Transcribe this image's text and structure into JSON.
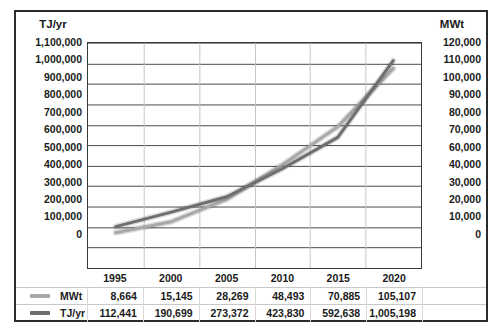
{
  "chart_data": {
    "type": "line",
    "title": "",
    "xlabel": "",
    "categories": [
      "1995",
      "2000",
      "2005",
      "2010",
      "2015",
      "2020"
    ],
    "grid": true,
    "legend_position": "bottom-table",
    "axes": {
      "left": {
        "label": "TJ/yr",
        "ticks": [
          "1,100,000",
          "1,000,000",
          "900,000",
          "800,000",
          "700,000",
          "600,000",
          "500,000",
          "400,000",
          "300,000",
          "200,000",
          "100,000",
          "0"
        ],
        "min": 0,
        "max": 1100000,
        "step": 100000
      },
      "right": {
        "label": "MWt",
        "ticks": [
          "120,000",
          "110,000",
          "100,000",
          "90,000",
          "80,000",
          "70,000",
          "60,000",
          "40,000",
          "30,000",
          "20,000",
          "10,000",
          "0"
        ],
        "min": 0,
        "max": 120000,
        "step": 10000
      }
    },
    "series": [
      {
        "name": "MWt",
        "axis": "right",
        "color": "#a8a8a8",
        "values": [
          8664,
          15145,
          28269,
          48493,
          70885,
          105107
        ],
        "values_text": [
          "8,664",
          "15,145",
          "28,269",
          "48,493",
          "70,885",
          "105,107"
        ]
      },
      {
        "name": "TJ/yr",
        "axis": "left",
        "color": "#6e6e6e",
        "values": [
          112441,
          190699,
          273372,
          423830,
          592638,
          1005198
        ],
        "values_text": [
          "112,441",
          "190,699",
          "273,372",
          "423,830",
          "592,638",
          "1,005,198"
        ]
      }
    ]
  },
  "table": {
    "years": [
      "1995",
      "2000",
      "2005",
      "2010",
      "2015",
      "2020"
    ],
    "rows": [
      {
        "label": "MWt",
        "color": "#a8a8a8",
        "cells": [
          "8,664",
          "15,145",
          "28,269",
          "48,493",
          "70,885",
          "105,107"
        ]
      },
      {
        "label": "TJ/yr",
        "color": "#6e6e6e",
        "cells": [
          "112,441",
          "190,699",
          "273,372",
          "423,830",
          "592,638",
          "1,005,198"
        ]
      }
    ]
  }
}
